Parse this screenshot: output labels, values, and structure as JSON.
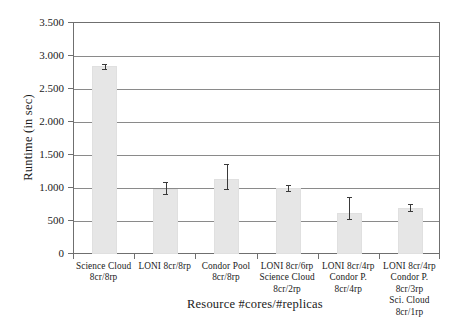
{
  "chart_data": {
    "type": "bar",
    "title": "",
    "xlabel": "Resource #cores/#replicas",
    "ylabel": "Runtime (in sec)",
    "ylim": [
      0,
      3500
    ],
    "ytick_labels": [
      "0",
      "500",
      "1.000",
      "1.500",
      "2.000",
      "2.500",
      "3.000",
      "3.500"
    ],
    "ytick_values": [
      0,
      500,
      1000,
      1500,
      2000,
      2500,
      3000,
      3500
    ],
    "grid": true,
    "legend": "none",
    "bar_color": "#e6e6e6",
    "error_color": "#3a3a3a",
    "axis_color": "#6f6f6f",
    "categories": [
      "Science Cloud\n8cr/8rp",
      "LONI 8cr/8rp",
      "Condor Pool\n8cr/8rp",
      "LONI 8cr/6rp\nScience Cloud\n8cr/2rp",
      "LONI 8cr/4rp\nCondor P.\n8cr/4rp",
      "LONI 8cr/4rp\nCondor P. 8cr/3rp\nSci. Cloud 8cr/1rp"
    ],
    "values": [
      2850,
      985,
      1130,
      1000,
      620,
      700
    ],
    "errors_low": [
      2810,
      905,
      985,
      955,
      530,
      645
    ],
    "errors_high": [
      2880,
      1095,
      1365,
      1045,
      870,
      765
    ]
  }
}
